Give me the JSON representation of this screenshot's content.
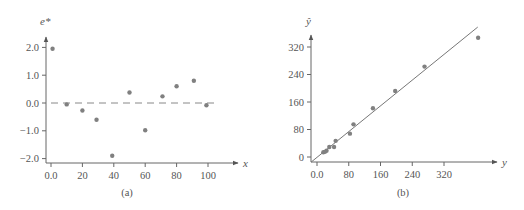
{
  "chart_data": [
    {
      "type": "scatter",
      "panel_label": "(a)",
      "xlabel": "x",
      "ylabel": "e*",
      "xlim": [
        0,
        100
      ],
      "ylim": [
        -2.0,
        2.0
      ],
      "x_ticks": [
        0,
        20,
        40,
        60,
        80,
        100
      ],
      "x_tick_labels": [
        "0.0",
        "20",
        "40",
        "60",
        "80",
        "100"
      ],
      "y_ticks": [
        -2.0,
        -1.0,
        0.0,
        1.0,
        2.0
      ],
      "y_tick_labels": [
        "−2.0",
        "−1.0",
        "0.0",
        "1.0",
        "2.0"
      ],
      "grid": false,
      "reference_line": {
        "style": "dashed",
        "y": 0.0,
        "x_from": 0,
        "x_to": 104
      },
      "points": [
        {
          "x": 1,
          "y": 1.95
        },
        {
          "x": 10,
          "y": -0.05
        },
        {
          "x": 20,
          "y": -0.27
        },
        {
          "x": 29,
          "y": -0.6
        },
        {
          "x": 39,
          "y": -1.9
        },
        {
          "x": 50,
          "y": 0.38
        },
        {
          "x": 60,
          "y": -0.98
        },
        {
          "x": 71,
          "y": 0.24
        },
        {
          "x": 80,
          "y": 0.6
        },
        {
          "x": 91,
          "y": 0.8
        },
        {
          "x": 99,
          "y": -0.08
        }
      ]
    },
    {
      "type": "scatter",
      "panel_label": "(b)",
      "xlabel": "y",
      "ylabel": "ŷ",
      "xlim": [
        0,
        400
      ],
      "ylim": [
        0,
        360
      ],
      "x_ticks": [
        0,
        80,
        160,
        240,
        320
      ],
      "x_tick_labels": [
        "0.0",
        "80",
        "160",
        "240",
        "320"
      ],
      "y_ticks": [
        0,
        80,
        160,
        240,
        320
      ],
      "y_tick_labels": [
        "0",
        "80",
        "160",
        "240",
        "320"
      ],
      "grid": false,
      "fit_line": {
        "style": "solid",
        "from": {
          "x": -15,
          "y": -15
        },
        "to": {
          "x": 405,
          "y": 378
        }
      },
      "points": [
        {
          "x": 16,
          "y": 14
        },
        {
          "x": 20,
          "y": 15
        },
        {
          "x": 24,
          "y": 18
        },
        {
          "x": 31,
          "y": 29
        },
        {
          "x": 43,
          "y": 29
        },
        {
          "x": 47,
          "y": 47
        },
        {
          "x": 83,
          "y": 68
        },
        {
          "x": 92,
          "y": 95
        },
        {
          "x": 141,
          "y": 142
        },
        {
          "x": 197,
          "y": 192
        },
        {
          "x": 271,
          "y": 263
        },
        {
          "x": 406,
          "y": 347
        }
      ]
    }
  ]
}
